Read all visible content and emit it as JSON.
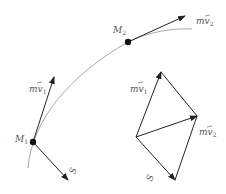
{
  "diagram": {
    "colors": {
      "vector": "#222222",
      "trajectory": "#aaaaaa",
      "point": "#111111",
      "label": "#555555"
    },
    "points": {
      "M1": {
        "label": "M",
        "sub": "1"
      },
      "M2": {
        "label": "M",
        "sub": "2"
      }
    },
    "vectors": {
      "mv1": {
        "label": "mv",
        "sub": "1"
      },
      "mv2": {
        "label": "mv",
        "sub": "2"
      },
      "S": {
        "label": "S"
      }
    },
    "parallelogram": {
      "mv1": {
        "label": "mv",
        "sub": "1"
      },
      "mv2": {
        "label": "mv",
        "sub": "2"
      },
      "S": {
        "label": "S"
      }
    }
  }
}
